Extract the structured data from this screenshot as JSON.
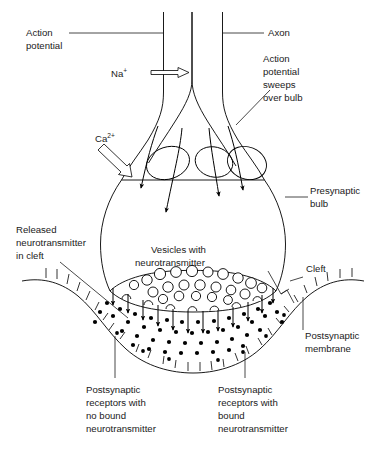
{
  "figure": {
    "background_color": "#ffffff",
    "line_color": "#000000",
    "text_color": "#1a1a1a"
  },
  "labels": {
    "action_potential": "Action\npotential",
    "action_potential_line1": "Action",
    "action_potential_line2": "potential",
    "axon": "Axon",
    "sodium_ion": "Na",
    "sodium_charge": "+",
    "calcium_ion": "Ca",
    "calcium_charge": "2+",
    "ap_sweeps_line1": "Action",
    "ap_sweeps_line2": "potential",
    "ap_sweeps_line3": "sweeps",
    "ap_sweeps_line4": "over bulb",
    "presynaptic_bulb_line1": "Presynaptic",
    "presynaptic_bulb_line2": "bulb",
    "released_nt_line1": "Released",
    "released_nt_line2": "neurotransmitter",
    "released_nt_line3": "in cleft",
    "vesicles_line1": "Vesicles with",
    "vesicles_line2": "neurotransmitter",
    "cleft": "Cleft",
    "postsynaptic_membrane_line1": "Postsynaptic",
    "postsynaptic_membrane_line2": "membrane",
    "receptors_unbound_line1": "Postsynaptic",
    "receptors_unbound_line2": "receptors with",
    "receptors_unbound_line3": "no bound",
    "receptors_unbound_line4": "neurotransmitter",
    "receptors_bound_line1": "Postsynaptic",
    "receptors_bound_line2": "receptors with",
    "receptors_bound_line3": "bound",
    "receptors_bound_line4": "neurotransmitter"
  },
  "diagram_elements": {
    "vesicle_count": 22,
    "neurotransmitter_dot_count": 58,
    "release_arrow_count": 12,
    "receptor_tick_count": 26,
    "bound_receptor_count": 9,
    "calcium_influx_arrow_count": 4
  }
}
